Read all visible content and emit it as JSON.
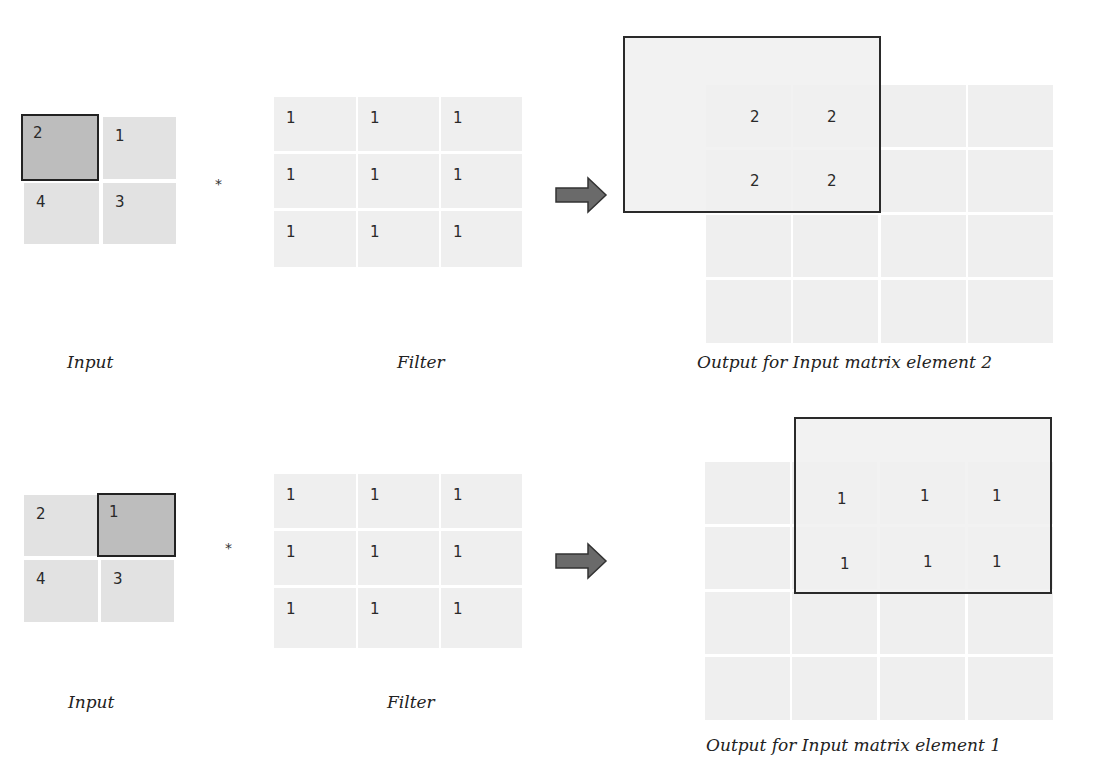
{
  "rows": [
    {
      "input": {
        "cells": [
          "2",
          "1",
          "4",
          "3"
        ],
        "highlighted_index": 0,
        "label": "Input"
      },
      "operator": "*",
      "filter": {
        "cells": [
          "1",
          "1",
          "1",
          "1",
          "1",
          "1",
          "1",
          "1",
          "1"
        ],
        "label": "Filter"
      },
      "output": {
        "grid_size": "4x4",
        "box_values": [
          "2",
          "2",
          "2",
          "2"
        ],
        "label": "Output for Input matrix element 2"
      }
    },
    {
      "input": {
        "cells": [
          "2",
          "1",
          "4",
          "3"
        ],
        "highlighted_index": 1,
        "label": "Input"
      },
      "operator": "*",
      "filter": {
        "cells": [
          "1",
          "1",
          "1",
          "1",
          "1",
          "1",
          "1",
          "1",
          "1"
        ],
        "label": "Filter"
      },
      "output": {
        "grid_size": "4x4",
        "box_values": [
          "1",
          "1",
          "1",
          "1",
          "1",
          "1"
        ],
        "label": "Output for Input matrix element 1"
      }
    }
  ],
  "colors": {
    "input_cell": "#e2e2e2",
    "input_highlight": "#bdbdbd",
    "filter_cell": "#efefef",
    "output_cell": "#efefef",
    "arrow": "#6a6a6a",
    "border": "#222222"
  }
}
